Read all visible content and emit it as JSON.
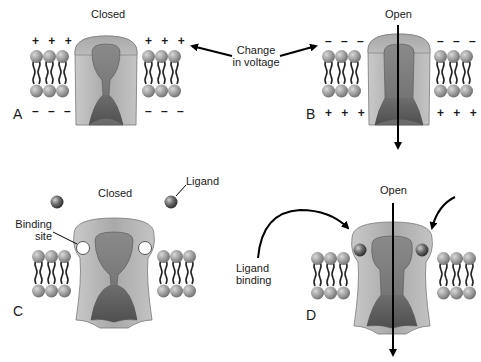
{
  "figure": {
    "panels": [
      {
        "letter": "A",
        "state_label": "Closed",
        "gating": "voltage",
        "top_charges": "+ + +",
        "bottom_charges": "– – –"
      },
      {
        "letter": "B",
        "state_label": "Open",
        "gating": "voltage",
        "top_charges": "– – –",
        "bottom_charges": "+ + +"
      },
      {
        "letter": "C",
        "state_label": "Closed",
        "gating": "ligand"
      },
      {
        "letter": "D",
        "state_label": "Open",
        "gating": "ligand"
      }
    ],
    "annotations": {
      "change_in_voltage": {
        "line1": "Change",
        "line2": "in voltage"
      },
      "ligand": "Ligand",
      "binding_site": {
        "line1": "Binding",
        "line2": "site"
      },
      "ligand_binding": {
        "line1": "Ligand",
        "line2": "binding"
      }
    },
    "colors": {
      "lipid_head": "#9a9a9a",
      "lipid_tail": "#222222",
      "channel_outer": "#b8b8b8",
      "channel_inner": "#7a7a7a",
      "channel_pore_dark": "#5e5e5e",
      "ligand": "#555555",
      "arrow": "#000000"
    }
  }
}
